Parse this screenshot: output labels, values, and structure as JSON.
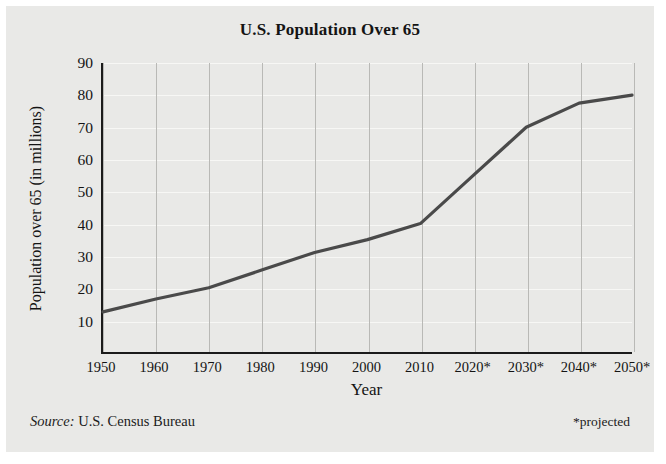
{
  "chart_data": {
    "type": "line",
    "title": "U.S. Population Over 65",
    "xlabel": "Year",
    "ylabel": "Population over 65 (in millions)",
    "categories": [
      "1950",
      "1960",
      "1970",
      "1980",
      "1990",
      "2000",
      "2010",
      "2020*",
      "2030*",
      "2040*",
      "2050*"
    ],
    "x": [
      1950,
      1960,
      1970,
      1980,
      1990,
      2000,
      2010,
      2020,
      2030,
      2040,
      2050
    ],
    "values": [
      12.5,
      16.5,
      20,
      25.5,
      31,
      35,
      40,
      55,
      70,
      77.5,
      80
    ],
    "ylim": [
      0,
      90
    ],
    "yticks": [
      90,
      80,
      70,
      60,
      50,
      40,
      30,
      20,
      10
    ],
    "xlim": [
      1950,
      2050
    ],
    "grid": true,
    "legend": "none",
    "line_color": "#4a4a4a",
    "axis_color": "#1b1b1b",
    "panel_color": "#e9e9e7"
  },
  "footer": {
    "source_word": "Source:",
    "source_value": "U.S. Census Bureau",
    "note": "*projected"
  }
}
